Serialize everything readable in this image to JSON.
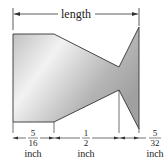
{
  "diagram": {
    "length_label": "length",
    "dims": [
      {
        "num": "5",
        "den": "16",
        "unit": "inch"
      },
      {
        "num": "1",
        "den": "2",
        "unit": "inch"
      },
      {
        "num": "5",
        "den": "32",
        "unit": "inch"
      }
    ],
    "colors": {
      "fill_light": "#f4f4f4",
      "fill_dark": "#a8a8a8",
      "stroke": "#333333"
    }
  }
}
